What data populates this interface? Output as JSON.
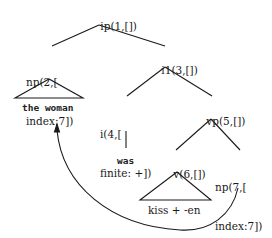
{
  "diagram": {
    "type": "syntax-tree",
    "nodes": [
      {
        "id": "ip1",
        "line1": "ip(1,[])",
        "line2": ""
      },
      {
        "id": "np2",
        "line1": "np(2,[",
        "line2": "index:7])"
      },
      {
        "id": "i1_3",
        "line1": "i1(3,[])",
        "line2": ""
      },
      {
        "id": "i4",
        "line1": "i(4,[",
        "line2": "finite: +])"
      },
      {
        "id": "vp5",
        "line1": "vp(5,[])",
        "line2": ""
      },
      {
        "id": "v6",
        "line1": "v(6,[])",
        "line2": ""
      },
      {
        "id": "np7",
        "line1": "np(7,[",
        "line2": "index:7])"
      }
    ],
    "leaves": {
      "np2": "the woman",
      "i4": "was",
      "v6": "kiss + -en"
    },
    "edges": [
      [
        "ip1",
        "np2"
      ],
      [
        "ip1",
        "i1_3"
      ],
      [
        "i1_3",
        "i4"
      ],
      [
        "i1_3",
        "vp5"
      ],
      [
        "vp5",
        "v6"
      ],
      [
        "vp5",
        "np7"
      ]
    ],
    "movement_arrow": {
      "from": "np7",
      "to": "np2"
    }
  }
}
